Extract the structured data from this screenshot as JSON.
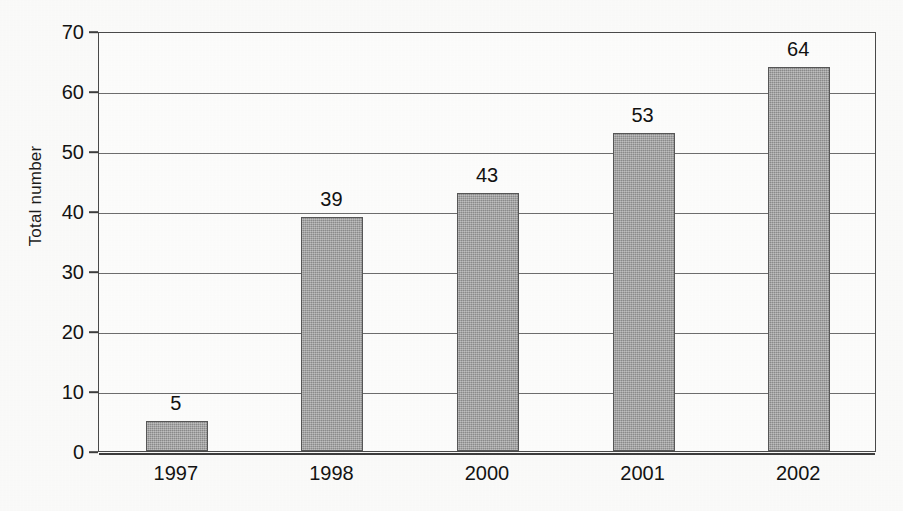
{
  "chart_data": {
    "type": "bar",
    "title": "",
    "subtitle": "",
    "xlabel": "",
    "ylabel": "Total number",
    "categories": [
      "1997",
      "1998",
      "2000",
      "2001",
      "2002"
    ],
    "values": [
      5,
      39,
      43,
      53,
      64
    ],
    "value_labels": [
      "5",
      "39",
      "43",
      "53",
      "64"
    ],
    "ylim": [
      0,
      70
    ],
    "ytick_labels": [
      "0",
      "10",
      "20",
      "30",
      "40",
      "50",
      "60",
      "70"
    ],
    "ytick_values": [
      0,
      10,
      20,
      30,
      40,
      50,
      60,
      70
    ],
    "grid": "horizontal",
    "legend": "none",
    "bar_color": "#9b9b9b",
    "bar_border_color": "#575757",
    "axis_color": "#3d3d3d",
    "gridline_color": "#6e6e6e",
    "text_color": "#131313",
    "background_color": "#fbfbfa"
  },
  "axes": {
    "y_title": "Total number"
  }
}
